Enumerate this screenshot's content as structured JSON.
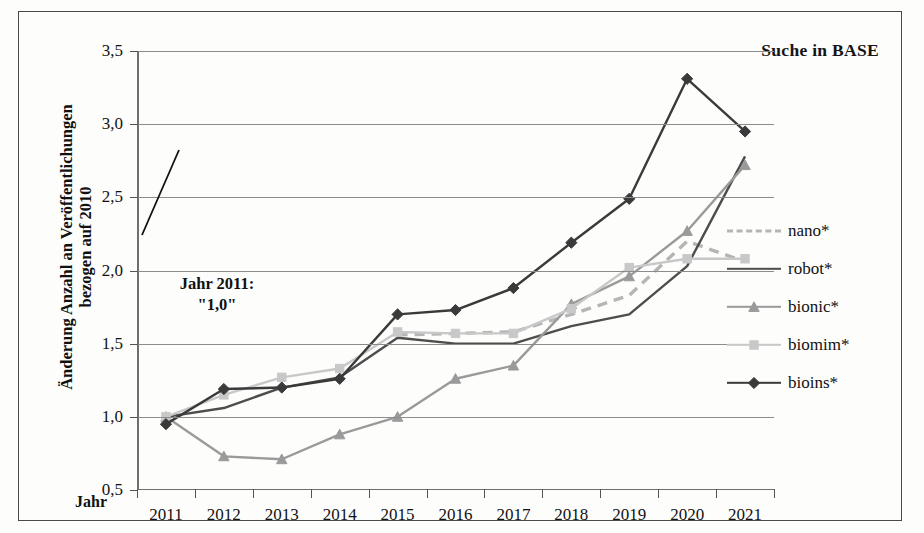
{
  "chart_title": "Suche in BASE",
  "y_axis_title_line1": "Änderung Anzahl an Veröffentlichungen",
  "y_axis_title_line2": "bezogen auf 2010",
  "x_axis_title": "Jahr",
  "annotation": {
    "line1": "Jahr 2011:",
    "line2": "\"1,0\""
  },
  "legend": {
    "items": [
      {
        "label": "nano*",
        "style": "dashed",
        "marker": "none",
        "color": "#b5b5b5"
      },
      {
        "label": "robot*",
        "style": "solid",
        "marker": "none",
        "color": "#4d4d4d"
      },
      {
        "label": "bionic*",
        "style": "solid",
        "marker": "triangle",
        "color": "#9a9a9a"
      },
      {
        "label": "biomim*",
        "style": "solid",
        "marker": "square",
        "color": "#c8c8c8"
      },
      {
        "label": "bioins*",
        "style": "solid",
        "marker": "diamond",
        "color": "#3a3a3a"
      }
    ]
  },
  "chart_data": {
    "type": "line",
    "title": "Suche in BASE",
    "xlabel": "Jahr",
    "ylabel": "Änderung Anzahl an Veröffentlichungen bezogen auf 2010",
    "categories": [
      "2011",
      "2012",
      "2013",
      "2014",
      "2015",
      "2016",
      "2017",
      "2018",
      "2019",
      "2020",
      "2021"
    ],
    "x": [
      2011,
      2012,
      2013,
      2014,
      2015,
      2016,
      2017,
      2018,
      2019,
      2020,
      2021
    ],
    "ylim": [
      0.5,
      3.5
    ],
    "yticks": [
      "0,5",
      "1,0",
      "1,5",
      "2,0",
      "2,5",
      "3,0",
      "3,5"
    ],
    "ytick_values": [
      0.5,
      1.0,
      1.5,
      2.0,
      2.5,
      3.0,
      3.5
    ],
    "grid": true,
    "legend_position": "right",
    "annotation_text": "Jahr 2011: \"1,0\"",
    "series": [
      {
        "name": "nano*",
        "color": "#b5b5b5",
        "style": "dashed",
        "marker": "none",
        "values": [
          null,
          null,
          null,
          null,
          1.56,
          1.57,
          1.58,
          1.7,
          1.83,
          2.2,
          2.06
        ]
      },
      {
        "name": "robot*",
        "color": "#4d4d4d",
        "style": "solid",
        "marker": "none",
        "values": [
          1.0,
          1.06,
          1.2,
          1.27,
          1.54,
          1.5,
          1.5,
          1.62,
          1.7,
          2.03,
          2.78
        ]
      },
      {
        "name": "bionic*",
        "color": "#9a9a9a",
        "style": "solid",
        "marker": "triangle",
        "values": [
          1.0,
          0.73,
          0.71,
          0.88,
          1.0,
          1.26,
          1.35,
          1.77,
          1.96,
          2.27,
          2.72
        ]
      },
      {
        "name": "biomim*",
        "color": "#c8c8c8",
        "style": "solid",
        "marker": "square",
        "values": [
          1.0,
          1.15,
          1.27,
          1.33,
          1.58,
          1.57,
          1.57,
          1.74,
          2.02,
          2.08,
          2.08
        ]
      },
      {
        "name": "bioins*",
        "color": "#3a3a3a",
        "style": "solid",
        "marker": "diamond",
        "values": [
          0.95,
          1.19,
          1.2,
          1.26,
          1.7,
          1.73,
          1.88,
          2.19,
          2.49,
          3.31,
          2.95
        ]
      }
    ]
  }
}
